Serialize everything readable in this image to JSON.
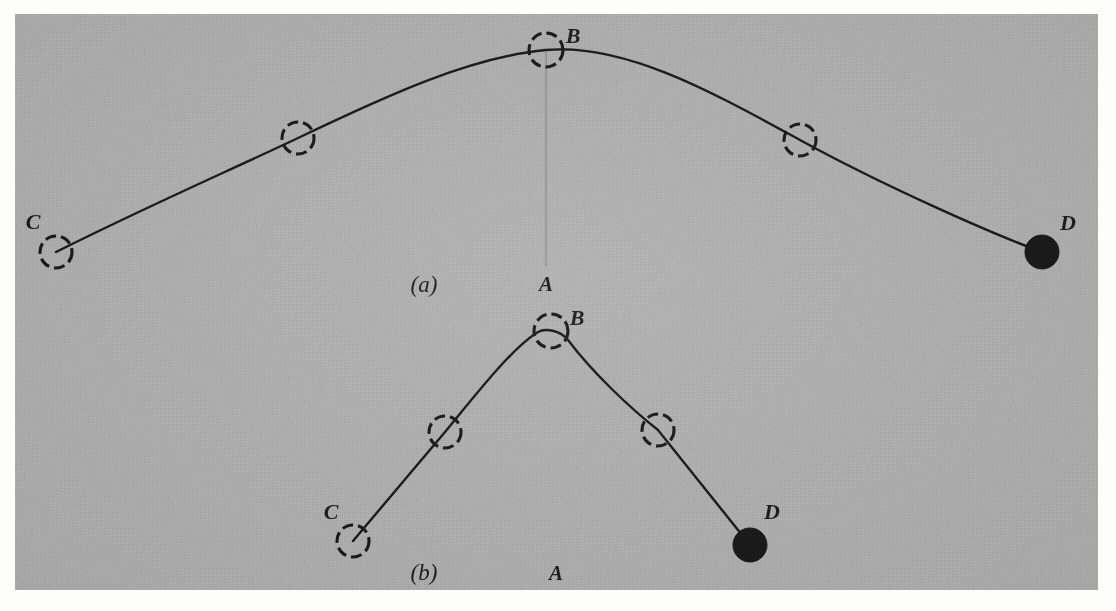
{
  "figure": {
    "kind": "physics-diagram",
    "plate": {
      "background_color": "#b4b4b4",
      "paper_color": "#fdfdfb",
      "ink_color": "#1a1a1a",
      "x": 15,
      "y": 14,
      "width": 1083,
      "height": 576
    },
    "panels": [
      {
        "id": "a",
        "caption": "(a)",
        "caption_x": 424,
        "caption_y": 292,
        "ground": {
          "label": "A",
          "label_x": 546,
          "label_y": 291,
          "x1": 30,
          "y1": 269,
          "x2": 1083,
          "y2": 269
        },
        "vertical_drop": {
          "from_x": 546,
          "from_y": 52,
          "to_x": 546,
          "to_y": 266,
          "faint": true
        },
        "path_type": "flat-arc",
        "nodes": [
          {
            "name": "C",
            "label": "C",
            "label_x": 33,
            "label_y": 229,
            "cx": 56,
            "cy": 252,
            "r": 16,
            "fill": "hollow"
          },
          {
            "name": "P1",
            "label": "",
            "cx": 298,
            "cy": 138,
            "r": 16,
            "fill": "hollow"
          },
          {
            "name": "B",
            "label": "B",
            "label_x": 573,
            "label_y": 43,
            "cx": 546,
            "cy": 50,
            "r": 17,
            "fill": "hollow"
          },
          {
            "name": "P2",
            "label": "",
            "cx": 800,
            "cy": 140,
            "r": 16,
            "fill": "hollow"
          },
          {
            "name": "D",
            "label": "D",
            "label_x": 1068,
            "label_y": 230,
            "cx": 1042,
            "cy": 252,
            "r": 17,
            "fill": "solid"
          }
        ]
      },
      {
        "id": "b",
        "caption": "(b)",
        "caption_x": 424,
        "caption_y": 580,
        "ground": {
          "label": "A",
          "label_x": 556,
          "label_y": 580,
          "x1": 285,
          "y1": 558,
          "x2": 827,
          "y2": 558
        },
        "path_type": "steep-arc",
        "nodes": [
          {
            "name": "C",
            "label": "C",
            "label_x": 331,
            "label_y": 519,
            "cx": 353,
            "cy": 541,
            "r": 16,
            "fill": "hollow"
          },
          {
            "name": "P1",
            "label": "",
            "cx": 445,
            "cy": 432,
            "r": 16,
            "fill": "hollow"
          },
          {
            "name": "B",
            "label": "B",
            "label_x": 577,
            "label_y": 325,
            "cx": 551,
            "cy": 331,
            "r": 17,
            "fill": "hollow"
          },
          {
            "name": "P2",
            "label": "",
            "cx": 658,
            "cy": 430,
            "r": 16,
            "fill": "hollow"
          },
          {
            "name": "D",
            "label": "D",
            "label_x": 772,
            "label_y": 519,
            "cx": 750,
            "cy": 545,
            "r": 17,
            "fill": "solid"
          }
        ]
      }
    ],
    "labels": {
      "point_a": "A",
      "point_b": "B",
      "point_c": "C",
      "point_d": "D",
      "caption_a": "(a)",
      "caption_b": "(b)"
    }
  }
}
